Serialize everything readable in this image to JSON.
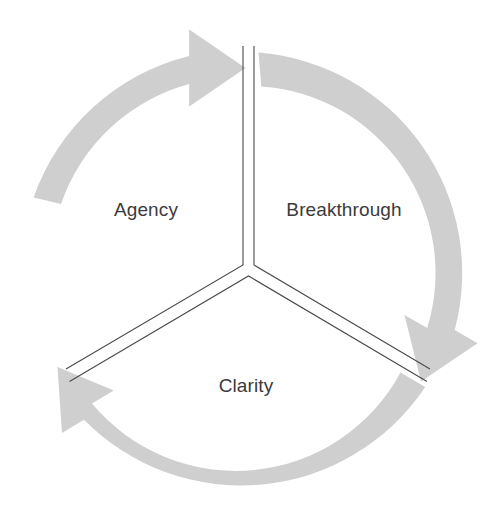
{
  "diagram": {
    "type": "cycle",
    "title": "",
    "direction": "clockwise",
    "background_color": "#ffffff",
    "arc_color": "#cfcfcf",
    "divider_color": "#4a4a4a",
    "label_color": "#3b3b3b",
    "sector_count": 3,
    "sectors": [
      {
        "id": "agency",
        "label": "Agency"
      },
      {
        "id": "breakthrough",
        "label": "Breakthrough"
      },
      {
        "id": "clarity",
        "label": "Clarity"
      }
    ],
    "arrows": [
      {
        "id": "arrow-top",
        "points_to": "breakthrough",
        "direction": "clockwise"
      },
      {
        "id": "arrow-lower-right",
        "points_to": "clarity",
        "direction": "clockwise"
      },
      {
        "id": "arrow-lower-left",
        "points_to": "agency",
        "direction": "clockwise"
      }
    ]
  }
}
